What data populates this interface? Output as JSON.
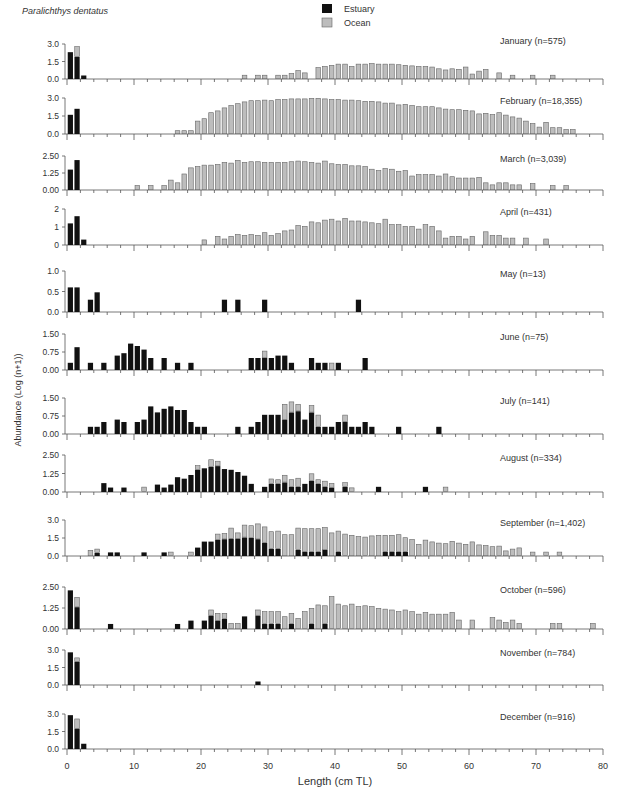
{
  "chart_data": {
    "type": "bar",
    "stacked": true,
    "species_label": "Paralichthys dentatus",
    "xlabel": "Length (cm TL)",
    "ylabel": "Abundance (Log (n+1))",
    "xlim": [
      0,
      80
    ],
    "xticks": [
      0,
      10,
      20,
      30,
      40,
      50,
      60,
      70,
      80
    ],
    "legend": [
      {
        "name": "Estuary",
        "color": "#111111"
      },
      {
        "name": "Ocean",
        "color": "#bdbdbd"
      }
    ],
    "bin_width_cm": 1,
    "panels": [
      {
        "month": "January",
        "label": "January (n=575)",
        "yticks": [
          "0.0",
          "1.5",
          "3.0"
        ],
        "ymax": 3.0,
        "top": 44,
        "base": 79,
        "estuary": {
          "1": 2.3,
          "2": 1.9,
          "3": 0.3
        },
        "ocean": {
          "2": 0.9,
          "27": 0.35,
          "29": 0.35,
          "30": 0.35,
          "32": 0.35,
          "33": 0.35,
          "34": 0.5,
          "35": 0.75,
          "36": 0.55,
          "38": 1.0,
          "39": 1.1,
          "40": 1.2,
          "41": 1.3,
          "42": 1.3,
          "43": 1.1,
          "44": 1.3,
          "45": 1.3,
          "46": 1.35,
          "47": 1.3,
          "48": 1.3,
          "49": 1.3,
          "50": 1.25,
          "51": 1.2,
          "52": 1.15,
          "53": 1.1,
          "54": 1.1,
          "55": 1.05,
          "56": 0.9,
          "57": 0.8,
          "58": 0.9,
          "59": 0.85,
          "60": 1.05,
          "61": 0.45,
          "62": 0.7,
          "63": 0.85,
          "65": 0.55,
          "67": 0.35,
          "70": 0.35,
          "73": 0.35
        }
      },
      {
        "month": "February",
        "label": "February (n=18,355)",
        "yticks": [
          "0.0",
          "1.5",
          "3.0"
        ],
        "ymax": 3.0,
        "top": 98,
        "base": 134,
        "estuary": {
          "1": 1.6,
          "2": 2.1
        },
        "ocean": {
          "17": 0.3,
          "18": 0.3,
          "19": 0.3,
          "20": 1.1,
          "21": 1.3,
          "22": 1.8,
          "23": 1.95,
          "24": 2.2,
          "25": 2.4,
          "26": 2.55,
          "27": 2.7,
          "28": 2.8,
          "29": 2.8,
          "30": 2.85,
          "31": 2.8,
          "32": 2.9,
          "33": 2.9,
          "34": 2.95,
          "35": 2.95,
          "36": 2.95,
          "37": 3.0,
          "38": 3.0,
          "39": 2.95,
          "40": 2.9,
          "41": 2.9,
          "42": 2.85,
          "43": 2.85,
          "44": 2.8,
          "45": 2.75,
          "46": 2.75,
          "47": 2.7,
          "48": 2.6,
          "49": 2.6,
          "50": 2.45,
          "51": 2.5,
          "52": 2.4,
          "53": 2.3,
          "54": 2.3,
          "55": 2.3,
          "56": 2.2,
          "57": 2.1,
          "58": 2.05,
          "59": 2.05,
          "60": 2.0,
          "61": 1.95,
          "62": 1.7,
          "63": 1.75,
          "64": 1.65,
          "65": 1.8,
          "66": 1.6,
          "67": 1.45,
          "68": 1.35,
          "69": 1.1,
          "70": 0.9,
          "71": 0.6,
          "72": 1.0,
          "73": 0.55,
          "74": 0.55,
          "75": 0.4,
          "76": 0.4
        }
      },
      {
        "month": "March",
        "label": "March (n=3,039)",
        "yticks": [
          "0.00",
          "1.25",
          "2.50"
        ],
        "ymax": 2.5,
        "top": 156,
        "base": 190,
        "estuary": {
          "1": 1.5,
          "2": 2.2
        },
        "ocean": {
          "11": 0.35,
          "13": 0.35,
          "15": 0.35,
          "16": 0.75,
          "17": 0.55,
          "18": 1.2,
          "19": 1.65,
          "20": 1.75,
          "21": 1.85,
          "22": 1.85,
          "23": 1.9,
          "24": 2.05,
          "25": 2.0,
          "26": 2.2,
          "27": 2.05,
          "28": 2.1,
          "29": 2.1,
          "30": 2.05,
          "31": 2.05,
          "32": 2.05,
          "33": 2.05,
          "34": 2.1,
          "35": 2.15,
          "36": 2.1,
          "37": 2.05,
          "38": 2.0,
          "39": 2.15,
          "40": 1.95,
          "41": 1.9,
          "42": 1.9,
          "43": 1.8,
          "44": 1.8,
          "45": 1.75,
          "46": 1.55,
          "47": 1.45,
          "48": 1.6,
          "49": 1.55,
          "50": 1.4,
          "51": 1.45,
          "52": 1.05,
          "53": 1.15,
          "54": 1.15,
          "55": 1.15,
          "56": 1.05,
          "57": 1.2,
          "58": 1.0,
          "59": 0.9,
          "60": 0.9,
          "61": 0.9,
          "62": 0.95,
          "63": 0.55,
          "64": 0.4,
          "65": 0.55,
          "66": 0.55,
          "67": 0.4,
          "68": 0.4,
          "70": 0.5,
          "73": 0.35,
          "75": 0.35
        }
      },
      {
        "month": "April",
        "label": "April (n=431)",
        "yticks": [
          "0",
          "1",
          "2"
        ],
        "ymax": 2,
        "top": 209,
        "base": 245,
        "estuary": {
          "1": 1.2,
          "2": 1.6,
          "3": 0.3
        },
        "ocean": {
          "21": 0.3,
          "23": 0.5,
          "24": 0.35,
          "25": 0.5,
          "26": 0.6,
          "27": 0.55,
          "28": 0.6,
          "29": 0.55,
          "30": 0.7,
          "31": 0.55,
          "32": 0.65,
          "33": 0.8,
          "34": 0.85,
          "35": 1.1,
          "36": 1.05,
          "37": 1.3,
          "38": 1.25,
          "39": 1.4,
          "40": 1.45,
          "41": 1.35,
          "42": 1.5,
          "43": 1.35,
          "44": 1.35,
          "45": 1.3,
          "46": 1.25,
          "47": 1.2,
          "48": 1.45,
          "49": 1.15,
          "50": 1.15,
          "51": 1.05,
          "52": 1.05,
          "53": 0.9,
          "54": 1.15,
          "55": 1.05,
          "56": 0.8,
          "57": 0.4,
          "58": 0.5,
          "59": 0.5,
          "60": 0.35,
          "61": 0.5,
          "63": 0.75,
          "64": 0.55,
          "65": 0.55,
          "66": 0.4,
          "67": 0.4,
          "69": 0.4,
          "72": 0.35
        }
      },
      {
        "month": "May",
        "label": "May (n=13)",
        "yticks": [
          "0.0",
          "0.5",
          "1.0"
        ],
        "ymax": 1.0,
        "top": 271,
        "base": 312,
        "estuary": {
          "1": 0.6,
          "2": 0.6,
          "4": 0.3,
          "5": 0.48,
          "24": 0.3,
          "26": 0.3,
          "30": 0.3,
          "44": 0.3
        },
        "ocean": {}
      },
      {
        "month": "June",
        "label": "June (n=75)",
        "yticks": [
          "0.00",
          "0.75",
          "1.50"
        ],
        "ymax": 1.5,
        "top": 334,
        "base": 370,
        "estuary": {
          "1": 0.3,
          "2": 0.95,
          "4": 0.3,
          "6": 0.3,
          "8": 0.6,
          "9": 0.7,
          "10": 1.1,
          "11": 1.0,
          "12": 0.85,
          "13": 0.5,
          "15": 0.5,
          "17": 0.3,
          "19": 0.3,
          "28": 0.5,
          "29": 0.5,
          "30": 0.5,
          "31": 0.5,
          "32": 0.6,
          "33": 0.6,
          "34": 0.3,
          "37": 0.5,
          "38": 0.3,
          "39": 0.3,
          "41": 0.3,
          "45": 0.5
        },
        "ocean": {
          "30": 0.3,
          "40": 0.3
        }
      },
      {
        "month": "July",
        "label": "July (n=141)",
        "yticks": [
          "0.00",
          "0.75",
          "1.50"
        ],
        "ymax": 1.5,
        "top": 398,
        "base": 434,
        "estuary": {
          "4": 0.3,
          "5": 0.3,
          "6": 0.5,
          "8": 0.6,
          "9": 0.5,
          "11": 0.5,
          "12": 0.6,
          "13": 1.15,
          "14": 0.9,
          "15": 1.05,
          "16": 1.15,
          "17": 1.0,
          "18": 1.0,
          "19": 0.5,
          "20": 0.3,
          "21": 0.3,
          "26": 0.3,
          "28": 0.3,
          "29": 0.5,
          "30": 0.8,
          "31": 0.8,
          "32": 0.8,
          "33": 0.6,
          "34": 0.9,
          "35": 0.95,
          "36": 0.6,
          "37": 0.9,
          "38": 0.3,
          "39": 0.3,
          "40": 0.3,
          "41": 0.5,
          "42": 0.5,
          "43": 0.3,
          "44": 0.3,
          "45": 0.5,
          "46": 0.3,
          "50": 0.3,
          "56": 0.3
        },
        "ocean": {
          "33": 0.65,
          "34": 0.45,
          "35": 0.3,
          "37": 0.3,
          "38": 0.5,
          "42": 0.3
        }
      },
      {
        "month": "August",
        "label": "August (n=334)",
        "yticks": [
          "0.00",
          "1.25",
          "2.50"
        ],
        "ymax": 2.5,
        "top": 455,
        "base": 492,
        "estuary": {
          "6": 0.6,
          "7": 0.3,
          "9": 0.3,
          "14": 0.5,
          "15": 0.3,
          "16": 0.5,
          "17": 1.0,
          "18": 0.9,
          "19": 1.15,
          "20": 1.5,
          "21": 1.6,
          "22": 1.7,
          "23": 1.75,
          "24": 1.55,
          "25": 1.5,
          "26": 1.35,
          "27": 1.1,
          "28": 0.55,
          "30": 0.35,
          "31": 0.55,
          "32": 0.55,
          "33": 0.65,
          "34": 0.35,
          "35": 0.35,
          "36": 0.55,
          "37": 0.75,
          "38": 0.55,
          "39": 0.35,
          "40": 0.3,
          "42": 0.35,
          "47": 0.35,
          "54": 0.35
        },
        "ocean": {
          "12": 0.35,
          "20": 0.3,
          "22": 0.5,
          "23": 0.35,
          "31": 0.35,
          "32": 0.3,
          "33": 0.5,
          "34": 0.5,
          "35": 0.6,
          "37": 0.5,
          "38": 0.3,
          "39": 0.4,
          "40": 0.3,
          "42": 0.3,
          "43": 0.3,
          "57": 0.35
        }
      },
      {
        "month": "September",
        "label": "September (n=1,402)",
        "yticks": [
          "0.0",
          "1.5",
          "3.0"
        ],
        "ymax": 3.0,
        "top": 520,
        "base": 556,
        "estuary": {
          "5": 0.25,
          "7": 0.3,
          "8": 0.3,
          "12": 0.3,
          "15": 0.3,
          "20": 0.7,
          "21": 1.2,
          "22": 1.2,
          "23": 1.35,
          "24": 1.4,
          "25": 1.45,
          "26": 1.45,
          "27": 1.55,
          "28": 1.5,
          "29": 1.4,
          "30": 1.1,
          "31": 0.6,
          "32": 0.6,
          "35": 0.5,
          "36": 0.35,
          "37": 0.35,
          "38": 0.35,
          "39": 0.5,
          "41": 0.35,
          "48": 0.35,
          "49": 0.35,
          "50": 0.35,
          "51": 0.35
        },
        "ocean": {
          "4": 0.5,
          "5": 0.35,
          "16": 0.35,
          "19": 0.35,
          "23": 0.5,
          "24": 0.5,
          "25": 0.9,
          "26": 0.5,
          "27": 1.05,
          "28": 1.05,
          "29": 1.3,
          "30": 1.35,
          "31": 1.45,
          "32": 1.5,
          "33": 1.8,
          "34": 1.8,
          "35": 1.85,
          "36": 1.95,
          "37": 1.95,
          "38": 1.95,
          "39": 1.9,
          "40": 1.95,
          "41": 1.75,
          "42": 1.85,
          "43": 1.75,
          "44": 1.65,
          "45": 1.6,
          "46": 1.7,
          "47": 1.75,
          "48": 1.4,
          "49": 1.4,
          "50": 1.45,
          "51": 1.2,
          "52": 1.4,
          "53": 1.0,
          "54": 1.35,
          "55": 1.2,
          "56": 1.1,
          "57": 1.05,
          "58": 1.25,
          "59": 1.1,
          "60": 1.0,
          "61": 1.2,
          "62": 0.95,
          "63": 0.9,
          "64": 0.8,
          "65": 0.85,
          "66": 0.45,
          "67": 0.6,
          "68": 0.7,
          "70": 0.35,
          "72": 0.35,
          "74": 0.35
        }
      },
      {
        "month": "October",
        "label": "October (n=596)",
        "yticks": [
          "0.00",
          "1.25",
          "2.50"
        ],
        "ymax": 2.5,
        "top": 587,
        "base": 629,
        "estuary": {
          "1": 2.3,
          "2": 1.3,
          "7": 0.3,
          "17": 0.3,
          "19": 0.5,
          "21": 0.5,
          "22": 0.8,
          "23": 0.5,
          "24": 0.6,
          "27": 0.75,
          "29": 0.8,
          "30": 0.3,
          "31": 0.3,
          "32": 0.3,
          "34": 0.3,
          "37": 0.3,
          "39": 0.3
        },
        "ocean": {
          "2": 0.6,
          "22": 0.35,
          "23": 0.45,
          "24": 0.35,
          "25": 0.35,
          "26": 0.35,
          "29": 0.35,
          "30": 0.75,
          "31": 0.75,
          "32": 0.75,
          "33": 0.75,
          "34": 0.65,
          "35": 0.65,
          "36": 1.05,
          "37": 0.95,
          "38": 1.45,
          "39": 1.1,
          "40": 1.95,
          "41": 1.5,
          "42": 1.4,
          "43": 1.5,
          "44": 1.35,
          "45": 1.4,
          "46": 1.35,
          "47": 1.25,
          "48": 1.2,
          "49": 1.15,
          "50": 1.05,
          "51": 1.15,
          "52": 1.05,
          "53": 0.9,
          "54": 1.0,
          "55": 0.9,
          "56": 0.9,
          "57": 0.9,
          "58": 1.0,
          "59": 0.55,
          "61": 0.55,
          "64": 0.7,
          "65": 0.55,
          "66": 0.4,
          "67": 0.55,
          "68": 0.35,
          "73": 0.35,
          "74": 0.35,
          "79": 0.35
        }
      },
      {
        "month": "November",
        "label": "November (n=784)",
        "yticks": [
          "0.0",
          "1.5",
          "3.0"
        ],
        "ymax": 3.0,
        "top": 650,
        "base": 685,
        "estuary": {
          "1": 2.8,
          "2": 2.0,
          "29": 0.3
        },
        "ocean": {
          "2": 0.35
        }
      },
      {
        "month": "December",
        "label": "December (n=916)",
        "yticks": [
          "0.0",
          "1.5",
          "3.0"
        ],
        "ymax": 3.0,
        "top": 714,
        "base": 749,
        "estuary": {
          "1": 2.9,
          "2": 1.75,
          "3": 0.45
        },
        "ocean": {
          "2": 0.85
        }
      }
    ]
  }
}
